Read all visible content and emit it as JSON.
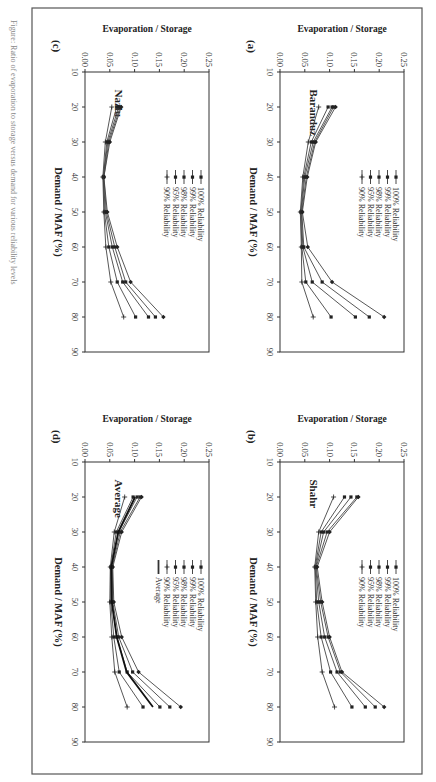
{
  "figure": {
    "caption": "Figure: Ratio of evaporation to storage versus demand for various reliability levels",
    "panels": [
      "(a)",
      "(b)",
      "(c)",
      "(d)"
    ]
  },
  "chart_data": [
    {
      "type": "line",
      "panel": "(a)",
      "title": "Baranduz",
      "xlabel": "Demand / MAF (%)",
      "ylabel": "Evaporation / Storage",
      "xlim": [
        10,
        90
      ],
      "ylim": [
        0,
        0.25
      ],
      "xticks": [
        10,
        20,
        30,
        40,
        50,
        60,
        70,
        80,
        90
      ],
      "yticks": [
        "0.00",
        "0.05",
        "0.10",
        "0.15",
        "0.20",
        "0.25"
      ],
      "x": [
        20,
        30,
        40,
        50,
        60,
        70,
        80
      ],
      "series": [
        {
          "name": "100% Reliability",
          "values": [
            0.112,
            0.072,
            0.055,
            0.045,
            0.056,
            0.105,
            0.21
          ]
        },
        {
          "name": "99% Reliability",
          "values": [
            0.108,
            0.07,
            0.053,
            0.044,
            0.048,
            0.085,
            0.18
          ]
        },
        {
          "name": "98% Reliability",
          "values": [
            0.105,
            0.067,
            0.05,
            0.043,
            0.046,
            0.065,
            0.152
          ]
        },
        {
          "name": "95% Reliability",
          "values": [
            0.097,
            0.063,
            0.048,
            0.042,
            0.044,
            0.052,
            0.103
          ]
        },
        {
          "name": "90% Reliability",
          "values": [
            0.078,
            0.057,
            0.046,
            0.041,
            0.043,
            0.044,
            0.067
          ]
        }
      ],
      "legend_position": "upper-left"
    },
    {
      "type": "line",
      "panel": "(b)",
      "title": "Shahr",
      "xlabel": "Demand / MAF (%)",
      "ylabel": "Evaporation / Storage",
      "xlim": [
        10,
        90
      ],
      "ylim": [
        0,
        0.25
      ],
      "xticks": [
        10,
        20,
        30,
        40,
        50,
        60,
        70,
        80,
        90
      ],
      "yticks": [
        "0.00",
        "0.05",
        "0.10",
        "0.15",
        "0.20",
        "0.25"
      ],
      "x": [
        20,
        30,
        40,
        50,
        60,
        70,
        80
      ],
      "series": [
        {
          "name": "100% Reliability",
          "values": [
            0.158,
            0.1,
            0.075,
            0.085,
            0.1,
            0.125,
            0.21
          ]
        },
        {
          "name": "99% Reliability",
          "values": [
            0.155,
            0.095,
            0.073,
            0.082,
            0.097,
            0.122,
            0.192
          ]
        },
        {
          "name": "98% Reliability",
          "values": [
            0.143,
            0.088,
            0.072,
            0.078,
            0.09,
            0.115,
            0.172
          ]
        },
        {
          "name": "95% Reliability",
          "values": [
            0.13,
            0.083,
            0.071,
            0.074,
            0.083,
            0.102,
            0.145
          ]
        },
        {
          "name": "90% Reliability",
          "values": [
            0.108,
            0.078,
            0.07,
            0.072,
            0.076,
            0.085,
            0.11
          ]
        }
      ],
      "legend_position": "upper-center"
    },
    {
      "type": "line",
      "panel": "(c)",
      "title": "Nazlu",
      "xlabel": "Demand / MAF (%)",
      "ylabel": "Evaporation / Storage",
      "xlim": [
        10,
        90
      ],
      "ylim": [
        0,
        0.25
      ],
      "xticks": [
        10,
        20,
        30,
        40,
        50,
        60,
        70,
        80,
        90
      ],
      "yticks": [
        "0.00",
        "0.05",
        "0.10",
        "0.15",
        "0.20",
        "0.25"
      ],
      "x": [
        20,
        30,
        40,
        50,
        60,
        70,
        80
      ],
      "series": [
        {
          "name": "100% Reliability",
          "values": [
            0.073,
            0.05,
            0.038,
            0.045,
            0.065,
            0.092,
            0.158
          ]
        },
        {
          "name": "99% Reliability",
          "values": [
            0.071,
            0.048,
            0.038,
            0.043,
            0.06,
            0.082,
            0.142
          ]
        },
        {
          "name": "98% Reliability",
          "values": [
            0.068,
            0.046,
            0.037,
            0.041,
            0.055,
            0.076,
            0.128
          ]
        },
        {
          "name": "95% Reliability",
          "values": [
            0.064,
            0.044,
            0.037,
            0.039,
            0.048,
            0.065,
            0.102
          ]
        },
        {
          "name": "90% Reliability",
          "values": [
            0.054,
            0.041,
            0.036,
            0.038,
            0.042,
            0.052,
            0.078
          ]
        }
      ],
      "legend_position": "upper-center"
    },
    {
      "type": "line",
      "panel": "(d)",
      "title": "Average",
      "xlabel": "Demand / MAF (%)",
      "ylabel": "Evaporation / Storage",
      "xlim": [
        10,
        90
      ],
      "ylim": [
        0,
        0.25
      ],
      "xticks": [
        10,
        20,
        30,
        40,
        50,
        60,
        70,
        80,
        90
      ],
      "yticks": [
        "0.00",
        "0.05",
        "0.10",
        "0.15",
        "0.20",
        "0.25"
      ],
      "x": [
        20,
        30,
        40,
        50,
        60,
        70,
        80
      ],
      "series": [
        {
          "name": "100% Reliability",
          "values": [
            0.114,
            0.074,
            0.056,
            0.058,
            0.074,
            0.108,
            0.193
          ]
        },
        {
          "name": "99% Reliability",
          "values": [
            0.111,
            0.071,
            0.055,
            0.056,
            0.068,
            0.096,
            0.171
          ]
        },
        {
          "name": "98% Reliability",
          "values": [
            0.105,
            0.068,
            0.053,
            0.054,
            0.064,
            0.085,
            0.151
          ]
        },
        {
          "name": "95% Reliability",
          "values": [
            0.097,
            0.063,
            0.052,
            0.052,
            0.058,
            0.069,
            0.117
          ]
        },
        {
          "name": "90% Reliability",
          "values": [
            0.08,
            0.059,
            0.051,
            0.05,
            0.054,
            0.06,
            0.085
          ]
        },
        {
          "name": "Average",
          "values": [
            0.101,
            0.067,
            0.053,
            0.054,
            0.064,
            0.084,
            0.137
          ]
        }
      ],
      "legend_position": "upper-center"
    }
  ]
}
